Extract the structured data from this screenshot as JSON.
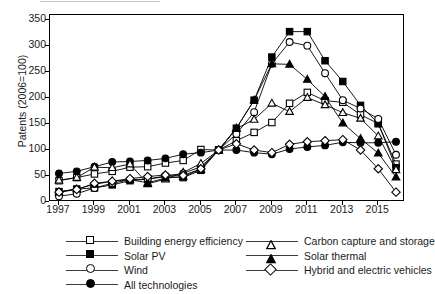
{
  "axes": {
    "ylabel": "Patents (2006=100)",
    "yticks": [
      0,
      50,
      100,
      150,
      200,
      250,
      300,
      350
    ],
    "xticks": [
      "1997",
      "1999",
      "2001",
      "2003",
      "2005",
      "2007",
      "2009",
      "2011",
      "2013",
      "2015"
    ]
  },
  "legend": {
    "col1": [
      {
        "label": "Building energy efficiency",
        "marker": "square-open"
      },
      {
        "label": "Solar PV",
        "marker": "square-filled"
      },
      {
        "label": "Wind",
        "marker": "circle-open"
      },
      {
        "label": "All technologies",
        "marker": "circle-filled"
      }
    ],
    "col2": [
      {
        "label": "Carbon capture and storage",
        "marker": "triangle-open"
      },
      {
        "label": "Solar thermal",
        "marker": "triangle-filled"
      },
      {
        "label": "Hybrid and electric vehicles",
        "marker": "diamond-open"
      }
    ]
  },
  "chart_data": {
    "type": "line",
    "title": "",
    "xlabel": "",
    "ylabel": "Patents (2006=100)",
    "xlim": [
      1997,
      2016
    ],
    "ylim": [
      0,
      360
    ],
    "grid": false,
    "legend_position": "bottom",
    "x": [
      1997,
      1998,
      1999,
      2000,
      2001,
      2002,
      2003,
      2004,
      2005,
      2006,
      2007,
      2008,
      2009,
      2010,
      2011,
      2012,
      2013,
      2014,
      2015,
      2016
    ],
    "series": [
      {
        "name": "Building energy efficiency",
        "marker": "square-open",
        "values": [
          41,
          47,
          54,
          59,
          67,
          68,
          75,
          80,
          101,
          100,
          118,
          134,
          153,
          190,
          211,
          195,
          192,
          168,
          151,
          73
        ]
      },
      {
        "name": "Solar PV",
        "marker": "square-filled",
        "values": [
          20,
          25,
          27,
          33,
          41,
          44,
          49,
          47,
          61,
          100,
          142,
          196,
          279,
          328,
          328,
          272,
          232,
          186,
          151,
          66
        ]
      },
      {
        "name": "Wind",
        "marker": "circle-open",
        "values": [
          11,
          16,
          27,
          36,
          43,
          44,
          50,
          55,
          68,
          100,
          131,
          173,
          266,
          308,
          301,
          248,
          196,
          180,
          160,
          91
        ]
      },
      {
        "name": "All technologies",
        "marker": "circle-filled",
        "values": [
          55,
          59,
          68,
          77,
          78,
          80,
          84,
          92,
          95,
          100,
          100,
          95,
          92,
          102,
          106,
          109,
          115,
          114,
          114,
          116
        ]
      },
      {
        "name": "Carbon capture and storage",
        "marker": "triangle-open",
        "values": [
          42,
          47,
          67,
          66,
          73,
          35,
          44,
          57,
          74,
          100,
          141,
          159,
          190,
          174,
          201,
          187,
          172,
          161,
          127,
          62
        ]
      },
      {
        "name": "Solar thermal",
        "marker": "triangle-filled",
        "values": [
          19,
          25,
          34,
          40,
          43,
          37,
          46,
          49,
          63,
          100,
          142,
          196,
          266,
          265,
          236,
          203,
          152,
          122,
          94,
          48
        ]
      },
      {
        "name": "Hybrid and electric vehicles",
        "marker": "diamond-open",
        "values": [
          19,
          24,
          36,
          40,
          45,
          49,
          52,
          51,
          64,
          100,
          112,
          100,
          95,
          111,
          116,
          118,
          120,
          100,
          64,
          19
        ]
      }
    ]
  }
}
